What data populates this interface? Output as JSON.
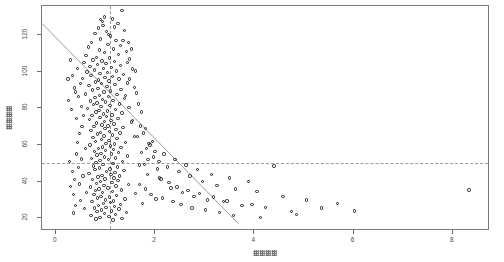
{
  "chart_data": {
    "type": "scatter",
    "title": "",
    "xlabel": "□□□□",
    "ylabel": "□□□□",
    "xlabel_note": "axis title rendered as unreadable tofu/garbled CJK glyph boxes",
    "ylabel_note": "axis title rendered as unreadable tofu/garbled CJK glyph boxes, rotated 90deg",
    "xlim": [
      -0.28,
      8.75
    ],
    "ylim": [
      13,
      136
    ],
    "xticks": [
      0,
      2,
      4,
      6,
      8
    ],
    "xticklabels": [
      "0",
      "2",
      "4",
      "6",
      "8"
    ],
    "yticks": [
      20,
      40,
      60,
      80,
      100,
      120
    ],
    "yticklabels": [
      "20",
      "40",
      "60",
      "80",
      "100",
      "120"
    ],
    "grid": false,
    "legend": null,
    "marker": "open-circle",
    "marker_color": "#1b1b1b",
    "frame_color": "#7a7a7a",
    "reference_lines": [
      {
        "name": "vertical-reference-line",
        "orientation": "vertical",
        "x": 1.1,
        "style": "dashed",
        "color": "#9b9b9b"
      },
      {
        "name": "horizontal-reference-line",
        "orientation": "horizontal",
        "y": 50,
        "style": "dashed",
        "color": "#9b9b9b"
      }
    ],
    "fit_line": {
      "name": "regression-line",
      "style": "solid",
      "color": "#9a9a9a",
      "x0": -0.28,
      "y0": 126.5,
      "x1": 3.68,
      "y1": 17.0
    },
    "points": [
      [
        1.33,
        133.5
      ],
      [
        0.86,
        124.0
      ],
      [
        0.95,
        125.5
      ],
      [
        1.02,
        122.0
      ],
      [
        0.79,
        121.0
      ],
      [
        1.1,
        119.5
      ],
      [
        0.9,
        118.0
      ],
      [
        1.21,
        117.0
      ],
      [
        0.72,
        116.0
      ],
      [
        1.05,
        115.0
      ],
      [
        0.66,
        113.5
      ],
      [
        1.16,
        112.5
      ],
      [
        0.88,
        112.0
      ],
      [
        1.42,
        111.0
      ],
      [
        0.98,
        110.5
      ],
      [
        1.26,
        109.5
      ],
      [
        0.61,
        109.0
      ],
      [
        0.82,
        108.0
      ],
      [
        1.08,
        107.5
      ],
      [
        1.48,
        107.0
      ],
      [
        0.75,
        106.5
      ],
      [
        0.93,
        106.0
      ],
      [
        1.18,
        105.5
      ],
      [
        0.57,
        105.0
      ],
      [
        1.01,
        104.5
      ],
      [
        0.84,
        104.0
      ],
      [
        1.3,
        103.5
      ],
      [
        0.69,
        103.0
      ],
      [
        1.12,
        102.5
      ],
      [
        0.96,
        102.0
      ],
      [
        1.55,
        101.5
      ],
      [
        0.78,
        101.0
      ],
      [
        1.22,
        100.5
      ],
      [
        0.63,
        100.0
      ],
      [
        1.04,
        99.5
      ],
      [
        0.89,
        99.0
      ],
      [
        1.36,
        98.5
      ],
      [
        0.71,
        98.0
      ],
      [
        1.14,
        97.5
      ],
      [
        0.99,
        97.0
      ],
      [
        0.54,
        96.5
      ],
      [
        1.27,
        96.0
      ],
      [
        0.86,
        95.5
      ],
      [
        1.07,
        95.0
      ],
      [
        0.8,
        94.5
      ],
      [
        1.44,
        94.0
      ],
      [
        0.92,
        93.5
      ],
      [
        1.19,
        93.0
      ],
      [
        0.67,
        92.5
      ],
      [
        1.03,
        92.0
      ],
      [
        0.85,
        91.0
      ],
      [
        1.31,
        90.5
      ],
      [
        0.74,
        90.0
      ],
      [
        1.1,
        89.5
      ],
      [
        0.97,
        89.0
      ],
      [
        1.62,
        88.5
      ],
      [
        0.6,
        88.0
      ],
      [
        1.23,
        87.5
      ],
      [
        0.88,
        87.0
      ],
      [
        1.06,
        86.5
      ],
      [
        0.79,
        86.0
      ],
      [
        1.38,
        85.5
      ],
      [
        0.94,
        85.0
      ],
      [
        1.15,
        84.5
      ],
      [
        0.7,
        84.0
      ],
      [
        1.0,
        83.5
      ],
      [
        0.83,
        83.0
      ],
      [
        1.28,
        82.5
      ],
      [
        0.76,
        82.0
      ],
      [
        1.09,
        81.5
      ],
      [
        0.91,
        81.0
      ],
      [
        1.47,
        80.5
      ],
      [
        0.64,
        80.0
      ],
      [
        1.2,
        79.5
      ],
      [
        0.87,
        79.0
      ],
      [
        1.04,
        78.5
      ],
      [
        0.81,
        78.0
      ],
      [
        1.33,
        77.5
      ],
      [
        0.96,
        77.0
      ],
      [
        1.13,
        76.5
      ],
      [
        0.73,
        76.0
      ],
      [
        1.02,
        75.5
      ],
      [
        0.89,
        75.0
      ],
      [
        1.25,
        74.5
      ],
      [
        0.68,
        74.0
      ],
      [
        1.11,
        73.5
      ],
      [
        0.98,
        73.0
      ],
      [
        1.52,
        72.5
      ],
      [
        0.82,
        72.0
      ],
      [
        1.17,
        71.5
      ],
      [
        0.93,
        71.0
      ],
      [
        1.05,
        70.5
      ],
      [
        0.77,
        70.0
      ],
      [
        1.35,
        69.5
      ],
      [
        0.99,
        69.0
      ],
      [
        1.21,
        68.5
      ],
      [
        0.71,
        68.0
      ],
      [
        1.08,
        67.5
      ],
      [
        0.9,
        67.0
      ],
      [
        1.29,
        66.5
      ],
      [
        0.84,
        66.0
      ],
      [
        1.14,
        65.5
      ],
      [
        0.97,
        65.0
      ],
      [
        1.58,
        64.5
      ],
      [
        0.75,
        64.0
      ],
      [
        1.23,
        63.5
      ],
      [
        0.92,
        63.0
      ],
      [
        1.07,
        62.5
      ],
      [
        0.8,
        62.0
      ],
      [
        1.4,
        61.5
      ],
      [
        1.01,
        61.0
      ],
      [
        1.18,
        60.5
      ],
      [
        0.69,
        60.0
      ],
      [
        1.1,
        59.5
      ],
      [
        0.94,
        59.0
      ],
      [
        1.31,
        58.5
      ],
      [
        0.86,
        58.0
      ],
      [
        1.16,
        57.5
      ],
      [
        1.0,
        57.0
      ],
      [
        0.78,
        56.5
      ],
      [
        1.26,
        56.0
      ],
      [
        0.91,
        55.5
      ],
      [
        1.12,
        55.0
      ],
      [
        0.83,
        54.5
      ],
      [
        1.44,
        54.0
      ],
      [
        0.98,
        53.5
      ],
      [
        1.2,
        53.0
      ],
      [
        0.72,
        52.5
      ],
      [
        1.06,
        52.0
      ],
      [
        0.89,
        51.5
      ],
      [
        1.34,
        51.0
      ],
      [
        0.81,
        50.5
      ],
      [
        1.15,
        50.0
      ],
      [
        0.95,
        49.5
      ],
      [
        1.68,
        49.0
      ],
      [
        0.76,
        48.5
      ],
      [
        1.24,
        48.0
      ],
      [
        0.88,
        47.5
      ],
      [
        1.09,
        47.0
      ],
      [
        0.79,
        46.5
      ],
      [
        1.37,
        46.0
      ],
      [
        1.02,
        45.5
      ],
      [
        1.19,
        45.0
      ],
      [
        0.67,
        44.5
      ],
      [
        1.11,
        44.0
      ],
      [
        0.93,
        43.5
      ],
      [
        1.28,
        43.0
      ],
      [
        0.85,
        42.5
      ],
      [
        1.17,
        42.0
      ],
      [
        0.99,
        41.5
      ],
      [
        0.74,
        41.0
      ],
      [
        1.25,
        40.5
      ],
      [
        0.9,
        40.0
      ],
      [
        1.13,
        39.5
      ],
      [
        0.82,
        39.0
      ],
      [
        1.46,
        38.5
      ],
      [
        0.97,
        38.0
      ],
      [
        1.21,
        37.5
      ],
      [
        0.7,
        37.0
      ],
      [
        1.05,
        36.5
      ],
      [
        0.87,
        36.0
      ],
      [
        1.32,
        35.5
      ],
      [
        0.8,
        35.0
      ],
      [
        1.14,
        34.5
      ],
      [
        0.94,
        34.0
      ],
      [
        1.61,
        33.5
      ],
      [
        0.77,
        33.0
      ],
      [
        1.22,
        32.5
      ],
      [
        0.91,
        32.0
      ],
      [
        1.08,
        31.5
      ],
      [
        0.84,
        31.0
      ],
      [
        1.39,
        30.5
      ],
      [
        1.0,
        30.0
      ],
      [
        1.16,
        29.5
      ],
      [
        0.73,
        29.0
      ],
      [
        1.1,
        28.5
      ],
      [
        0.96,
        28.0
      ],
      [
        1.3,
        27.5
      ],
      [
        0.86,
        27.0
      ],
      [
        1.18,
        26.5
      ],
      [
        1.01,
        26.0
      ],
      [
        0.78,
        25.5
      ],
      [
        1.27,
        25.0
      ],
      [
        0.92,
        24.5
      ],
      [
        1.12,
        24.0
      ],
      [
        0.83,
        23.5
      ],
      [
        1.42,
        23.0
      ],
      [
        0.98,
        22.5
      ],
      [
        1.2,
        22.0
      ],
      [
        0.71,
        21.5
      ],
      [
        1.07,
        21.0
      ],
      [
        0.89,
        20.5
      ],
      [
        1.33,
        20.0
      ],
      [
        0.81,
        19.5
      ],
      [
        1.15,
        19.0
      ],
      [
        0.6,
        58.2
      ],
      [
        0.52,
        52.4
      ],
      [
        0.45,
        47.8
      ],
      [
        0.55,
        43.1
      ],
      [
        0.48,
        38.6
      ],
      [
        0.62,
        34.2
      ],
      [
        0.5,
        29.8
      ],
      [
        0.58,
        25.4
      ],
      [
        0.42,
        55.0
      ],
      [
        0.38,
        41.0
      ],
      [
        0.35,
        33.0
      ],
      [
        0.44,
        61.5
      ],
      [
        0.4,
        27.0
      ],
      [
        0.33,
        45.5
      ],
      [
        0.3,
        37.2
      ],
      [
        0.28,
        50.9
      ],
      [
        0.36,
        22.8
      ],
      [
        0.47,
        66.3
      ],
      [
        0.53,
        70.1
      ],
      [
        0.41,
        74.6
      ],
      [
        0.31,
        79.4
      ],
      [
        0.26,
        84.2
      ],
      [
        0.39,
        88.9
      ],
      [
        0.49,
        93.5
      ],
      [
        0.34,
        98.1
      ],
      [
        0.43,
        101.8
      ],
      [
        0.29,
        106.4
      ],
      [
        0.24,
        96.0
      ],
      [
        0.37,
        91.2
      ],
      [
        0.46,
        86.5
      ],
      [
        0.51,
        81.0
      ],
      [
        0.56,
        76.2
      ],
      [
        1.72,
        56.0
      ],
      [
        1.78,
        49.5
      ],
      [
        1.85,
        44.0
      ],
      [
        1.69,
        38.5
      ],
      [
        1.92,
        33.0
      ],
      [
        1.75,
        28.0
      ],
      [
        1.88,
        61.0
      ],
      [
        1.97,
        53.5
      ],
      [
        2.05,
        47.0
      ],
      [
        2.12,
        41.5
      ],
      [
        1.81,
        36.0
      ],
      [
        2.02,
        30.5
      ],
      [
        2.18,
        55.0
      ],
      [
        2.25,
        48.0
      ],
      [
        2.09,
        42.0
      ],
      [
        2.32,
        36.5
      ],
      [
        2.15,
        31.0
      ],
      [
        2.4,
        52.0
      ],
      [
        2.48,
        45.5
      ],
      [
        2.28,
        39.5
      ],
      [
        2.55,
        34.0
      ],
      [
        2.36,
        29.0
      ],
      [
        2.62,
        49.0
      ],
      [
        2.7,
        43.0
      ],
      [
        2.44,
        37.0
      ],
      [
        2.78,
        32.0
      ],
      [
        2.52,
        27.5
      ],
      [
        2.86,
        46.5
      ],
      [
        2.95,
        40.0
      ],
      [
        2.66,
        35.0
      ],
      [
        3.05,
        30.0
      ],
      [
        2.74,
        25.5
      ],
      [
        3.14,
        44.0
      ],
      [
        3.25,
        38.0
      ],
      [
        2.9,
        33.5
      ],
      [
        3.38,
        29.0
      ],
      [
        3.02,
        24.5
      ],
      [
        3.5,
        42.0
      ],
      [
        3.62,
        36.0
      ],
      [
        3.18,
        31.5
      ],
      [
        3.75,
        27.0
      ],
      [
        3.3,
        23.0
      ],
      [
        3.88,
        40.0
      ],
      [
        4.05,
        34.5
      ],
      [
        3.45,
        29.5
      ],
      [
        4.22,
        26.0
      ],
      [
        3.58,
        21.5
      ],
      [
        4.4,
        48.5
      ],
      [
        4.58,
        32.0
      ],
      [
        3.95,
        27.5
      ],
      [
        4.75,
        23.5
      ],
      [
        4.12,
        20.5
      ],
      [
        5.05,
        30.0
      ],
      [
        5.35,
        25.5
      ],
      [
        4.85,
        22.0
      ],
      [
        5.68,
        28.0
      ],
      [
        6.02,
        24.0
      ],
      [
        8.33,
        35.5
      ],
      [
        1.35,
        117.0
      ],
      [
        1.52,
        112.5
      ],
      [
        1.44,
        105.0
      ],
      [
        1.61,
        100.5
      ],
      [
        1.48,
        96.0
      ],
      [
        1.58,
        91.5
      ],
      [
        1.4,
        87.0
      ],
      [
        1.66,
        82.5
      ],
      [
        1.72,
        78.0
      ],
      [
        1.55,
        73.5
      ],
      [
        1.8,
        69.0
      ],
      [
        1.64,
        64.5
      ],
      [
        1.9,
        60.0
      ],
      [
        2.0,
        56.5
      ],
      [
        1.86,
        52.0
      ],
      [
        1.76,
        66.5
      ],
      [
        1.95,
        62.0
      ],
      [
        1.7,
        70.5
      ],
      [
        1.83,
        58.0
      ],
      [
        2.08,
        51.0
      ],
      [
        0.98,
        130.0
      ],
      [
        1.25,
        126.5
      ],
      [
        0.9,
        128.5
      ],
      [
        1.18,
        124.5
      ],
      [
        1.06,
        120.5
      ],
      [
        1.38,
        122.5
      ],
      [
        0.94,
        127.5
      ],
      [
        1.14,
        129.0
      ],
      [
        1.3,
        114.5
      ],
      [
        1.46,
        116.0
      ]
    ]
  }
}
